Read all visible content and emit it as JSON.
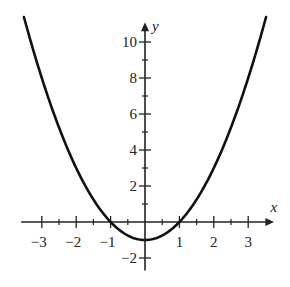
{
  "chart_data": {
    "type": "line",
    "title": "",
    "xlabel": "x",
    "ylabel": "y",
    "function": "y = x^2 - 1",
    "xlim": [
      -3.6,
      3.7
    ],
    "ylim": [
      -2.6,
      11.1
    ],
    "grid": false,
    "legend": null,
    "x_ticks": [
      -3,
      -2,
      -1,
      1,
      2,
      3
    ],
    "x_minor_ticks": [
      -2.5,
      -1.5,
      -0.5,
      0.5,
      1.5,
      2.5
    ],
    "y_ticks": [
      10,
      8,
      6,
      4,
      2,
      -2
    ],
    "y_minor_ticks": [
      9,
      7,
      5,
      3,
      1
    ],
    "x_tick_labels": [
      "−3",
      "−2",
      "−1",
      "1",
      "2",
      "3"
    ],
    "y_tick_labels": [
      "10",
      "8",
      "6",
      "4",
      "2",
      "−2"
    ],
    "series": [
      {
        "name": "parabola",
        "color": "#111111",
        "x": [
          -3.5,
          -3,
          -2.5,
          -2,
          -1.5,
          -1,
          -0.5,
          0,
          0.5,
          1,
          1.5,
          2,
          2.5,
          3,
          3.5
        ],
        "y": [
          11.25,
          8,
          5.25,
          3,
          1.25,
          0,
          -0.75,
          -1,
          -0.75,
          0,
          1.25,
          3,
          5.25,
          8,
          11.25
        ]
      }
    ],
    "key_points": {
      "vertex": [
        0,
        -1
      ],
      "x_intercepts": [
        [
          -1,
          0
        ],
        [
          1,
          0
        ]
      ]
    }
  }
}
